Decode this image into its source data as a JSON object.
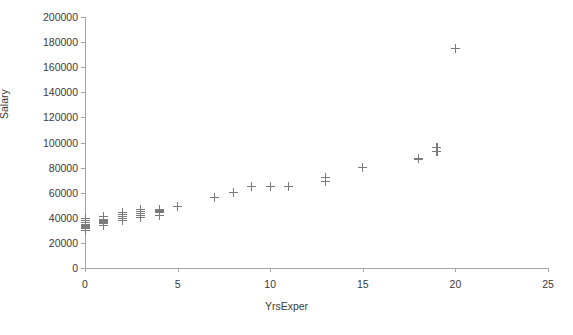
{
  "chart_data": {
    "type": "scatter",
    "title": "",
    "xlabel": "YrsExper",
    "ylabel": "Salary",
    "xlim": [
      0,
      25
    ],
    "ylim": [
      0,
      200000
    ],
    "xticks": [
      0,
      5,
      10,
      15,
      20,
      25
    ],
    "yticks": [
      0,
      20000,
      40000,
      60000,
      80000,
      100000,
      120000,
      140000,
      160000,
      180000,
      200000
    ],
    "xtick_labels": [
      "0",
      "5",
      "10",
      "15",
      "20",
      "25"
    ],
    "ytick_labels": [
      "0",
      "20000",
      "40000",
      "60000",
      "80000",
      "100000",
      "120000",
      "140000",
      "160000",
      "180000",
      "200000"
    ],
    "grid": false,
    "legend": false,
    "marker": "plus",
    "marker_color": "#7b7b7b",
    "axis_color": "#a6a6a6",
    "text_color": "#3a3a3a",
    "points": [
      {
        "x": 0,
        "y": 30000
      },
      {
        "x": 0,
        "y": 32000
      },
      {
        "x": 0,
        "y": 33500
      },
      {
        "x": 0,
        "y": 35000
      },
      {
        "x": 0,
        "y": 36500
      },
      {
        "x": 0,
        "y": 38000
      },
      {
        "x": 0,
        "y": 39500
      },
      {
        "x": 1,
        "y": 34000
      },
      {
        "x": 1,
        "y": 36000
      },
      {
        "x": 1,
        "y": 37500
      },
      {
        "x": 1,
        "y": 39000
      },
      {
        "x": 1,
        "y": 41000
      },
      {
        "x": 2,
        "y": 38000
      },
      {
        "x": 2,
        "y": 39500
      },
      {
        "x": 2,
        "y": 41000
      },
      {
        "x": 2,
        "y": 42500
      },
      {
        "x": 2,
        "y": 44000
      },
      {
        "x": 3,
        "y": 40000
      },
      {
        "x": 3,
        "y": 42000
      },
      {
        "x": 3,
        "y": 43500
      },
      {
        "x": 3,
        "y": 45000
      },
      {
        "x": 3,
        "y": 46500
      },
      {
        "x": 4,
        "y": 42000
      },
      {
        "x": 4,
        "y": 44000
      },
      {
        "x": 4,
        "y": 45500
      },
      {
        "x": 4,
        "y": 47000
      },
      {
        "x": 5,
        "y": 49000
      },
      {
        "x": 7,
        "y": 56000
      },
      {
        "x": 8,
        "y": 60000
      },
      {
        "x": 9,
        "y": 65000
      },
      {
        "x": 10,
        "y": 65000
      },
      {
        "x": 11,
        "y": 65000
      },
      {
        "x": 13,
        "y": 69000
      },
      {
        "x": 13,
        "y": 72000
      },
      {
        "x": 15,
        "y": 80000
      },
      {
        "x": 18,
        "y": 87000
      },
      {
        "x": 19,
        "y": 93000
      },
      {
        "x": 19,
        "y": 96000
      },
      {
        "x": 20,
        "y": 175000
      }
    ]
  }
}
